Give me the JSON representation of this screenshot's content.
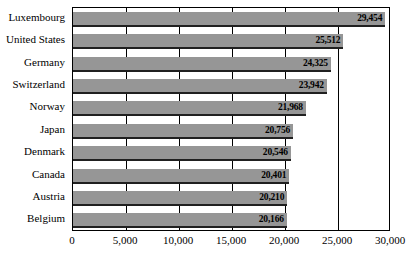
{
  "chart_data": {
    "type": "bar",
    "orientation": "horizontal",
    "title": "",
    "xlabel": "",
    "ylabel": "",
    "xlim": [
      0,
      30000
    ],
    "xticks": [
      "0",
      "5,000",
      "10,000",
      "15,000",
      "20,000",
      "25,000",
      "30,000"
    ],
    "xtick_values": [
      0,
      5000,
      10000,
      15000,
      20000,
      25000,
      30000
    ],
    "grid": true,
    "legend": false,
    "bar_color": "#969696",
    "bar_edge_color": "#202020",
    "categories": [
      "Luxembourg",
      "United States",
      "Germany",
      "Switzerland",
      "Norway",
      "Japan",
      "Denmark",
      "Canada",
      "Austria",
      "Belgium"
    ],
    "values": [
      29454,
      25512,
      24325,
      23942,
      21968,
      20756,
      20546,
      20401,
      20210,
      20166
    ],
    "value_labels": [
      "29,454",
      "25,512",
      "24,325",
      "23,942",
      "21,968",
      "20,756",
      "20,546",
      "20,401",
      "20,210",
      "20,166"
    ]
  }
}
